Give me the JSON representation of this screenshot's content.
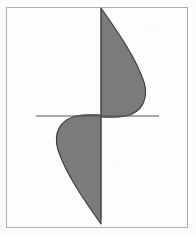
{
  "image": {
    "kind": "scanned-figure",
    "width": 196,
    "height": 236,
    "background_color": "#fcfcfb",
    "caption": ""
  },
  "frame": {
    "label": "figure-border",
    "color": "#b0b1b3",
    "x": 6,
    "y": 7,
    "width": 182,
    "height": 221,
    "stroke_width": 1
  },
  "chart_data": {
    "type": "area",
    "title": "",
    "subtitle": "",
    "xlabel": "",
    "ylabel": "",
    "grid": false,
    "legend": null,
    "axis_color": "#555555",
    "fill_color": "#7b7b7b",
    "outline_color": "#3a3a3a",
    "xlim": [
      36,
      160
    ],
    "ylim": [
      8,
      219
    ],
    "origin": {
      "x": 101,
      "y": 116
    },
    "axes": [
      {
        "name": "horizontal-axis",
        "orientation": "horizontal",
        "x1": 36,
        "y1": 116,
        "x2": 159,
        "y2": 116,
        "stroke_width": 1
      },
      {
        "name": "vertical-axis",
        "orientation": "vertical",
        "x1": 101,
        "y1": 8,
        "x2": 101,
        "y2": 219,
        "stroke_width": 1
      }
    ],
    "series": [
      {
        "name": "upper-lobe",
        "description": "teardrop lobe right of vertical axis, above horizontal axis",
        "apex": {
          "x": 101,
          "y": 8
        },
        "extreme": {
          "x": 145,
          "y": 88
        },
        "base": {
          "x": 101,
          "y": 117
        },
        "values": [
          0,
          14,
          28,
          40,
          44,
          38,
          22,
          0
        ]
      },
      {
        "name": "lower-lobe",
        "description": "teardrop lobe left of vertical axis, below horizontal axis (180 degree rotation of upper lobe)",
        "apex": {
          "x": 101,
          "y": 219
        },
        "extreme": {
          "x": 54,
          "y": 148
        },
        "base": {
          "x": 101,
          "y": 117
        },
        "values": [
          0,
          -14,
          -28,
          -40,
          -44,
          -38,
          -22,
          0
        ]
      }
    ],
    "annotations": []
  },
  "specks": [
    {
      "x": 151,
      "y": 26,
      "size": 2
    },
    {
      "x": 113,
      "y": 164,
      "size": 2
    },
    {
      "x": 46,
      "y": 196,
      "size": 1
    }
  ]
}
